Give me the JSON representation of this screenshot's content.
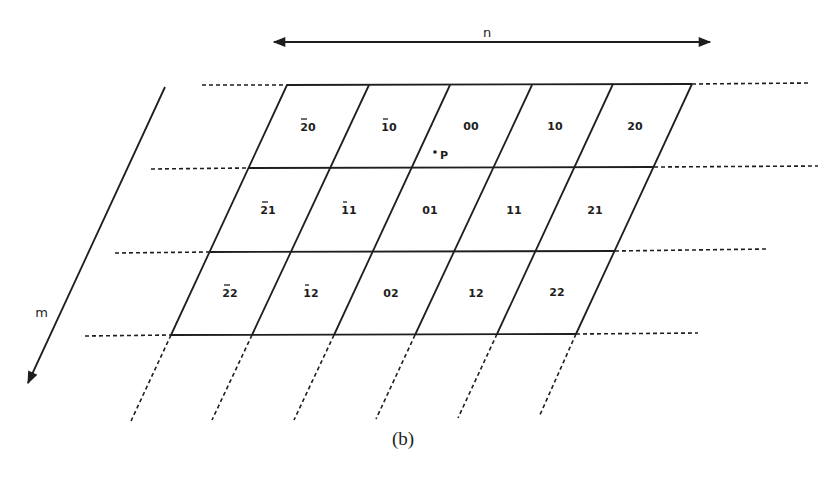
{
  "figure": {
    "caption": "(b)",
    "axes": {
      "n": {
        "label": "n",
        "direction": "horizontal, double-headed"
      },
      "m": {
        "label": "m",
        "direction": "down-left, single-headed"
      }
    },
    "point": {
      "label": "P"
    },
    "cells": [
      {
        "row": 0,
        "col": 0,
        "label": "20",
        "neg": "2"
      },
      {
        "row": 0,
        "col": 1,
        "label": "10",
        "neg": "1"
      },
      {
        "row": 0,
        "col": 2,
        "label": "00",
        "neg": ""
      },
      {
        "row": 0,
        "col": 3,
        "label": "10",
        "neg": ""
      },
      {
        "row": 0,
        "col": 4,
        "label": "20",
        "neg": ""
      },
      {
        "row": 1,
        "col": 0,
        "label": "21",
        "neg": "2"
      },
      {
        "row": 1,
        "col": 1,
        "label": "11",
        "neg": "1"
      },
      {
        "row": 1,
        "col": 2,
        "label": "01",
        "neg": ""
      },
      {
        "row": 1,
        "col": 3,
        "label": "11",
        "neg": ""
      },
      {
        "row": 1,
        "col": 4,
        "label": "21",
        "neg": ""
      },
      {
        "row": 2,
        "col": 0,
        "label": "22",
        "neg": "2"
      },
      {
        "row": 2,
        "col": 1,
        "label": "12",
        "neg": "1"
      },
      {
        "row": 2,
        "col": 2,
        "label": "02",
        "neg": ""
      },
      {
        "row": 2,
        "col": 3,
        "label": "12",
        "neg": ""
      },
      {
        "row": 2,
        "col": 4,
        "label": "22",
        "neg": ""
      }
    ],
    "cell_display": [
      "2̄0",
      "1̄0",
      "00",
      "10",
      "20",
      "2̄1",
      "1̄1",
      "01",
      "11",
      "21",
      "2̄2",
      "1̄2",
      "02",
      "12",
      "22"
    ]
  }
}
